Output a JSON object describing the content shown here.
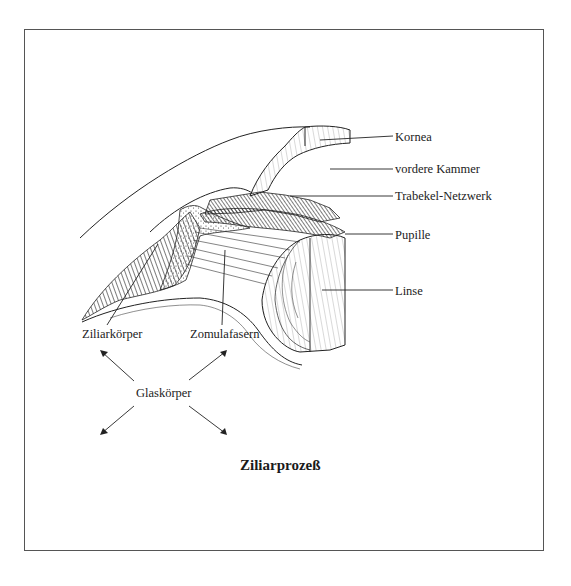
{
  "diagram": {
    "title": "Ziliarprozeß",
    "labels": {
      "kornea": "Kornea",
      "vordere_kammer": "vordere Kammer",
      "trabekel": "Trabekel-Netzwerk",
      "pupille": "Pupille",
      "linse": "Linse",
      "ziliarkoerper": "Ziliarkörper",
      "zonulafasern": "Zomulafasern",
      "glaskoerper": "Glaskörper"
    }
  }
}
